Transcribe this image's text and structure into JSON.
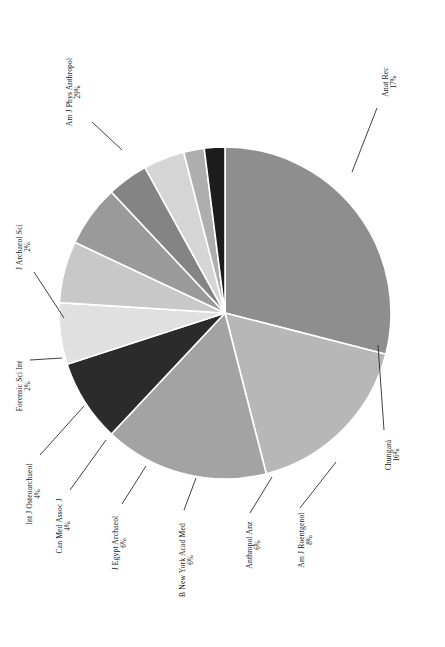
{
  "figure": {
    "orientation": "rotated-90-ccw",
    "background_color": "#ffffff",
    "caption": ""
  },
  "chart_data": {
    "type": "pie",
    "title": "",
    "xlabel": "",
    "ylabel": "",
    "legend_position": "none",
    "grid": false,
    "label_format": "name + percent",
    "separator_color": "#ffffff",
    "categories": [
      "Am J Phys Anthropol",
      "Anat Rec",
      "Chungará",
      "Am J Roentgenol",
      "Anthropol Anz",
      "B New York Acad Med",
      "J Egypt Archaeol",
      "Can Med Assoc J",
      "Int J Osteoarchaeol",
      "Forensic Sci Int",
      "J Archaeol Sci"
    ],
    "values": [
      29,
      17,
      16,
      8,
      6,
      6,
      6,
      4,
      4,
      2,
      2
    ],
    "percent_labels": [
      "29%",
      "17%",
      "16%",
      "8%",
      "6%",
      "6%",
      "6%",
      "4%",
      "4%",
      "2%",
      "2%"
    ],
    "colors": [
      "#8e8e8e",
      "#b7b7b7",
      "#a3a3a3",
      "#2b2b2b",
      "#e0e0e0",
      "#c8c8c8",
      "#9a9a9a",
      "#848484",
      "#d5d5d5",
      "#aeaeae",
      "#1c1c1c"
    ],
    "slices": [
      {
        "name": "Am J Phys Anthropol",
        "value": 29,
        "percent": "29%",
        "color": "#8e8e8e",
        "label_x": 72,
        "label_y": 92,
        "label_rot": -90,
        "leader": [
          [
            92,
            122
          ],
          [
            122,
            150
          ]
        ]
      },
      {
        "name": "Anat Rec",
        "value": 17,
        "percent": "17%",
        "color": "#b7b7b7",
        "label_x": 388,
        "label_y": 82,
        "label_rot": -90,
        "leader": [
          [
            377,
            108
          ],
          [
            352,
            172
          ]
        ]
      },
      {
        "name": "Chungará",
        "value": 16,
        "percent": "16%",
        "color": "#a3a3a3",
        "label_x": 391,
        "label_y": 455,
        "label_rot": -90,
        "leader": [
          [
            384,
            430
          ],
          [
            378,
            345
          ]
        ]
      },
      {
        "name": "Am J Roentgenol",
        "value": 8,
        "percent": "8%",
        "color": "#2b2b2b",
        "label_x": 304,
        "label_y": 540,
        "label_rot": -90,
        "leader": [
          [
            300,
            508
          ],
          [
            336,
            462
          ]
        ]
      },
      {
        "name": "Anthropol Anz",
        "value": 6,
        "percent": "6%",
        "color": "#e0e0e0",
        "label_x": 252,
        "label_y": 545,
        "label_rot": -90,
        "leader": [
          [
            250,
            513
          ],
          [
            272,
            477
          ]
        ]
      },
      {
        "name": "B New York Acad Med",
        "value": 6,
        "percent": "6%",
        "color": "#c8c8c8",
        "label_x": 185,
        "label_y": 560,
        "label_rot": -90,
        "leader": [
          [
            184,
            510
          ],
          [
            196,
            478
          ]
        ]
      },
      {
        "name": "J Egypt Archaeol",
        "value": 6,
        "percent": "6%",
        "color": "#9a9a9a",
        "label_x": 118,
        "label_y": 543,
        "label_rot": -90,
        "leader": [
          [
            122,
            504
          ],
          [
            146,
            466
          ]
        ]
      },
      {
        "name": "Can Med Assoc J",
        "value": 4,
        "percent": "4%",
        "color": "#848484",
        "label_x": 62,
        "label_y": 526,
        "label_rot": -90,
        "leader": [
          [
            70,
            490
          ],
          [
            106,
            440
          ]
        ]
      },
      {
        "name": "Int J Osteoarchaeol",
        "value": 4,
        "percent": "4%",
        "color": "#d5d5d5",
        "label_x": 32,
        "label_y": 494,
        "label_rot": -90,
        "leader": [
          [
            40,
            455
          ],
          [
            84,
            406
          ]
        ]
      },
      {
        "name": "Forensic Sci Int",
        "value": 2,
        "percent": "2%",
        "color": "#aeaeae",
        "label_x": 22,
        "label_y": 386,
        "label_rot": -90,
        "leader": [
          [
            30,
            360
          ],
          [
            62,
            358
          ]
        ]
      },
      {
        "name": "J Archaeol Sci",
        "value": 2,
        "percent": "2%",
        "color": "#1c1c1c",
        "label_x": 22,
        "label_y": 247,
        "label_rot": -90,
        "leader": [
          [
            34,
            272
          ],
          [
            64,
            318
          ]
        ]
      }
    ],
    "geometry": {
      "center_x": 225,
      "center_y": 313,
      "radius": 166,
      "start_angle_deg": -90
    }
  }
}
